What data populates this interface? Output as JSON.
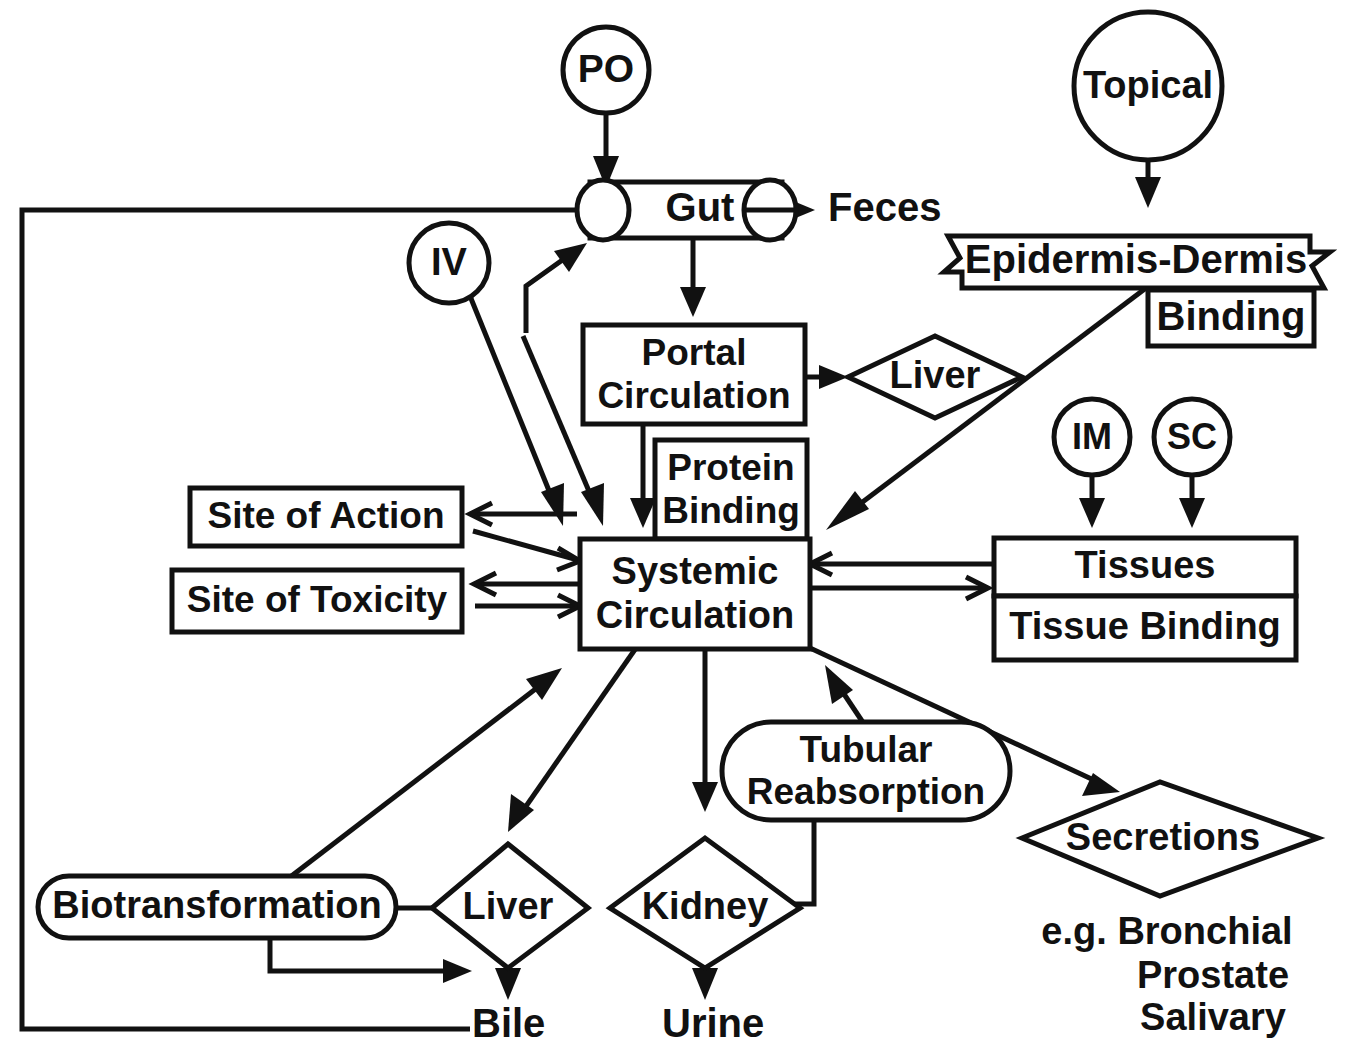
{
  "diagram": {
    "colors": {
      "stroke": "#111111",
      "fill": "#ffffff",
      "background": "#ffffff"
    },
    "routes": [
      {
        "id": "po",
        "label": "PO",
        "shape": "circle"
      },
      {
        "id": "iv",
        "label": "IV",
        "shape": "circle"
      },
      {
        "id": "topical",
        "label": "Topical",
        "shape": "circle"
      },
      {
        "id": "im",
        "label": "IM",
        "shape": "circle"
      },
      {
        "id": "sc",
        "label": "SC",
        "shape": "circle"
      }
    ],
    "nodes": [
      {
        "id": "gut",
        "label": "Gut",
        "shape": "cylinder"
      },
      {
        "id": "feces",
        "label": "Feces",
        "shape": "text"
      },
      {
        "id": "epidermis_dermis",
        "label": "Epidermis-Dermis",
        "shape": "banner"
      },
      {
        "id": "binding",
        "label": "Binding",
        "shape": "rect"
      },
      {
        "id": "portal_circulation_line1",
        "label": "Portal",
        "shape": "rect"
      },
      {
        "id": "portal_circulation_line2",
        "label": "Circulation",
        "shape": "rect"
      },
      {
        "id": "liver_upper",
        "label": "Liver",
        "shape": "diamond"
      },
      {
        "id": "protein_binding_line1",
        "label": "Protein",
        "shape": "rect"
      },
      {
        "id": "protein_binding_line2",
        "label": "Binding",
        "shape": "rect"
      },
      {
        "id": "systemic_circulation_line1",
        "label": "Systemic",
        "shape": "rect"
      },
      {
        "id": "systemic_circulation_line2",
        "label": "Circulation",
        "shape": "rect"
      },
      {
        "id": "site_of_action",
        "label": "Site of Action",
        "shape": "rect"
      },
      {
        "id": "site_of_toxicity",
        "label": "Site of Toxicity",
        "shape": "rect"
      },
      {
        "id": "tissues",
        "label": "Tissues",
        "shape": "rect"
      },
      {
        "id": "tissue_binding",
        "label": "Tissue Binding",
        "shape": "rect"
      },
      {
        "id": "biotransformation",
        "label": "Biotransformation",
        "shape": "stadium"
      },
      {
        "id": "liver_lower",
        "label": "Liver",
        "shape": "diamond"
      },
      {
        "id": "kidney",
        "label": "Kidney",
        "shape": "diamond"
      },
      {
        "id": "tubular_reabsorption_line1",
        "label": "Tubular",
        "shape": "stadium"
      },
      {
        "id": "tubular_reabsorption_line2",
        "label": "Reabsorption",
        "shape": "stadium"
      },
      {
        "id": "secretions",
        "label": "Secretions",
        "shape": "diamond"
      },
      {
        "id": "bile",
        "label": "Bile",
        "shape": "text"
      },
      {
        "id": "urine",
        "label": "Urine",
        "shape": "text"
      }
    ],
    "notes": {
      "secretions_examples_line1": "e.g. Bronchial",
      "secretions_examples_line2": "Prostate",
      "secretions_examples_line3": "Salivary"
    },
    "edges": [
      {
        "from": "po",
        "to": "gut",
        "style": "filled-arrow"
      },
      {
        "from": "gut",
        "to": "feces",
        "style": "filled-arrow"
      },
      {
        "from": "gut",
        "to": "portal_circulation",
        "style": "filled-arrow"
      },
      {
        "from": "bile_return",
        "to": "gut",
        "style": "plain-line"
      },
      {
        "from": "topical",
        "to": "epidermis_dermis",
        "style": "filled-arrow"
      },
      {
        "from": "epidermis_dermis",
        "to": "systemic_circulation",
        "style": "filled-arrow"
      },
      {
        "from": "portal_circulation",
        "to": "liver_upper",
        "style": "filled-arrow"
      },
      {
        "from": "portal_circulation",
        "to": "systemic_circulation",
        "style": "filled-arrow"
      },
      {
        "from": "iv",
        "to": "gut",
        "style": "filled-arrow"
      },
      {
        "from": "iv",
        "to": "systemic_circulation",
        "style": "filled-arrow"
      },
      {
        "from": "systemic_circulation",
        "to": "site_of_action",
        "style": "open-arrow-pair"
      },
      {
        "from": "systemic_circulation",
        "to": "site_of_toxicity",
        "style": "open-arrow-pair"
      },
      {
        "from": "systemic_circulation",
        "to": "tissues",
        "style": "open-arrow-pair"
      },
      {
        "from": "im",
        "to": "tissues",
        "style": "filled-arrow"
      },
      {
        "from": "sc",
        "to": "tissues",
        "style": "filled-arrow"
      },
      {
        "from": "biotransformation",
        "to": "systemic_circulation",
        "style": "filled-arrow"
      },
      {
        "from": "systemic_circulation",
        "to": "liver_lower",
        "style": "filled-arrow"
      },
      {
        "from": "systemic_circulation",
        "to": "kidney",
        "style": "filled-arrow"
      },
      {
        "from": "systemic_circulation",
        "to": "secretions",
        "style": "filled-arrow"
      },
      {
        "from": "tubular_reabsorption",
        "to": "systemic_circulation",
        "style": "filled-arrow"
      },
      {
        "from": "kidney",
        "to": "tubular_reabsorption",
        "style": "plain-line"
      },
      {
        "from": "biotransformation",
        "to": "liver_lower",
        "style": "filled-arrow"
      },
      {
        "from": "liver_lower",
        "to": "bile",
        "style": "filled-arrow"
      },
      {
        "from": "kidney",
        "to": "urine",
        "style": "filled-arrow"
      },
      {
        "from": "biotransformation",
        "to": "liver_diamond_left",
        "style": "plain-line"
      }
    ]
  }
}
